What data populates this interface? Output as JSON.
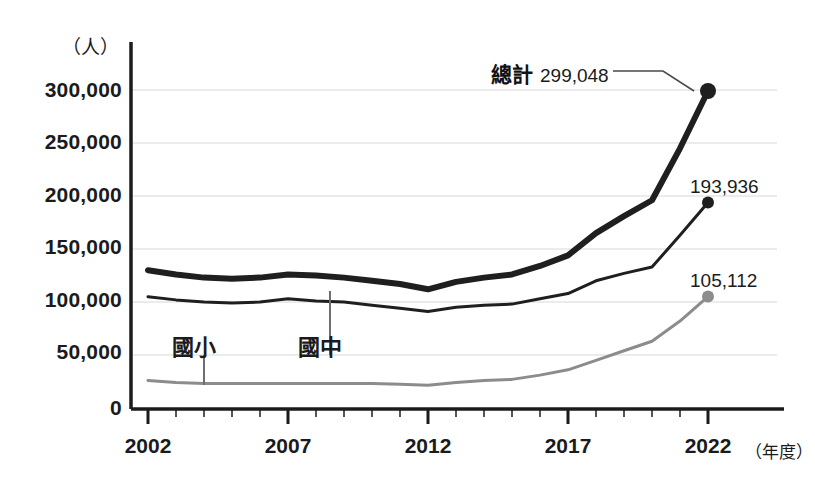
{
  "chart_data": {
    "type": "line",
    "title": "",
    "xlabel": "（年度）",
    "ylabel": "（人）",
    "x": [
      2002,
      2003,
      2004,
      2005,
      2006,
      2007,
      2008,
      2009,
      2010,
      2011,
      2012,
      2013,
      2014,
      2015,
      2016,
      2017,
      2018,
      2019,
      2020,
      2021,
      2022
    ],
    "xticklabels": [
      "2002",
      "2007",
      "2012",
      "2017",
      "2022"
    ],
    "xtickvalues": [
      2002,
      2007,
      2012,
      2017,
      2022
    ],
    "yticklabels": [
      "0",
      "50,000",
      "100,000",
      "150,000",
      "200,000",
      "250,000",
      "300,000"
    ],
    "ytickvalues": [
      0,
      50000,
      100000,
      150000,
      200000,
      250000,
      300000
    ],
    "ylim": [
      0,
      320000
    ],
    "xlim": [
      2002,
      2023
    ],
    "grid": true,
    "legend_position": "inline-annotation",
    "series": [
      {
        "name": "總計",
        "color": "#1f1f1f",
        "linewidth": 6,
        "endpoint_marker": true,
        "values": [
          130000,
          126000,
          123000,
          122000,
          123000,
          126000,
          125000,
          123000,
          120000,
          117000,
          112000,
          119000,
          123000,
          126000,
          134000,
          144000,
          165000,
          181000,
          196000,
          245000,
          299048
        ]
      },
      {
        "name": "國中",
        "color": "#1f1f1f",
        "linewidth": 3,
        "endpoint_marker": true,
        "values": [
          105000,
          102000,
          100000,
          99000,
          100000,
          103000,
          101000,
          100000,
          97000,
          94000,
          91000,
          95000,
          97000,
          98000,
          103000,
          108000,
          120000,
          127000,
          133000,
          163000,
          193936
        ]
      },
      {
        "name": "國小",
        "color": "#8c8c8c",
        "linewidth": 3,
        "endpoint_marker": true,
        "values": [
          26000,
          24000,
          23000,
          23000,
          23000,
          23000,
          23000,
          23000,
          23000,
          22500,
          21500,
          24000,
          26000,
          27000,
          31000,
          36000,
          45000,
          54000,
          63000,
          82000,
          105112
        ]
      }
    ],
    "annotations": [
      {
        "name": "total-callout",
        "label": "總計",
        "value": "299,048",
        "series": "總計",
        "x": 2022,
        "y": 299048
      },
      {
        "name": "junior-high-value",
        "label": "",
        "value": "193,936",
        "series": "國中",
        "x": 2022,
        "y": 193936
      },
      {
        "name": "elementary-value",
        "label": "",
        "value": "105,112",
        "series": "國小",
        "x": 2022,
        "y": 105112
      },
      {
        "name": "elementary-pointer",
        "label": "國小",
        "value": "",
        "series": "國小",
        "x": 2004,
        "y": 23000
      },
      {
        "name": "junior-high-pointer",
        "label": "國中",
        "value": "",
        "series": "國中",
        "x": 2009,
        "y": 100000
      }
    ]
  },
  "axis": {
    "y_unit": "（人）",
    "x_unit": "（年度）",
    "y_ticks": [
      "300,000",
      "250,000",
      "200,000",
      "150,000",
      "100,000",
      "50,000",
      "0"
    ],
    "x_ticks": [
      "2002",
      "2007",
      "2012",
      "2017",
      "2022"
    ]
  },
  "labels": {
    "elementary": "國小",
    "junior_high": "國中",
    "total_name": "總計",
    "total_value": "299,048",
    "junior_high_value": "193,936",
    "elementary_value": "105,112"
  },
  "colors": {
    "total_line": "#1f1f1f",
    "junior_high_line": "#1f1f1f",
    "elementary_line": "#8c8c8c",
    "grid": "#d8d8d8",
    "axis": "#1b1b1b",
    "text": "#1b1b1b"
  }
}
